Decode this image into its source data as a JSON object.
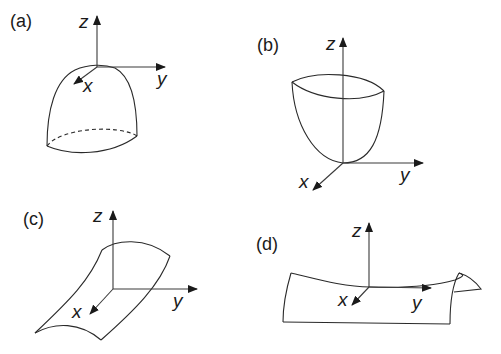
{
  "figure": {
    "panels": [
      {
        "id": "a",
        "label": "(a)",
        "axes": {
          "x": "x",
          "y": "y",
          "z": "z"
        },
        "surface": "dome (cap opening downward)"
      },
      {
        "id": "b",
        "label": "(b)",
        "axes": {
          "x": "x",
          "y": "y",
          "z": "z"
        },
        "surface": "bowl (paraboloid opening upward)"
      },
      {
        "id": "c",
        "label": "(c)",
        "axes": {
          "x": "x",
          "y": "y",
          "z": "z"
        },
        "surface": "cylindrical sheet curved along x"
      },
      {
        "id": "d",
        "label": "(d)",
        "axes": {
          "x": "x",
          "y": "y",
          "z": "z"
        },
        "surface": "saddle-like sheet curved along y"
      }
    ]
  }
}
